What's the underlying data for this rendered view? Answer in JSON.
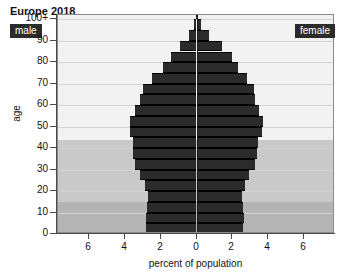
{
  "chart_data": {
    "type": "bar",
    "subtype": "population-pyramid",
    "title": "Europe 2018",
    "xlabel": "percent of population",
    "ylabel": "age",
    "xlim": [
      -7.75,
      7.75
    ],
    "ylim": [
      0,
      102
    ],
    "xticks": [
      -6,
      -4,
      -2,
      0,
      2,
      4,
      6
    ],
    "xticklabels": [
      "6",
      "4",
      "2",
      "0",
      "2",
      "4",
      "6"
    ],
    "yticks": [
      0,
      10,
      20,
      30,
      40,
      50,
      60,
      70,
      80,
      90,
      100
    ],
    "yticklabels": [
      "0",
      "10",
      "20",
      "30",
      "40",
      "50",
      "60",
      "70",
      "80",
      "90",
      "100+"
    ],
    "grid": "horizontal",
    "legend_position": "inside-top-corners",
    "series": [
      {
        "name": "male",
        "side": "left",
        "label": "male"
      },
      {
        "name": "female",
        "side": "right",
        "label": "female"
      }
    ],
    "age_groups": [
      "0-4",
      "5-9",
      "10-14",
      "15-19",
      "20-24",
      "25-29",
      "30-34",
      "35-39",
      "40-44",
      "45-49",
      "50-54",
      "55-59",
      "60-64",
      "65-69",
      "70-74",
      "75-79",
      "80-84",
      "85-89",
      "90-94",
      "95-99",
      "100+"
    ],
    "male_values": [
      2.85,
      2.85,
      2.75,
      2.7,
      2.9,
      3.15,
      3.45,
      3.55,
      3.55,
      3.7,
      3.7,
      3.45,
      3.15,
      3.0,
      2.5,
      1.85,
      1.45,
      0.9,
      0.4,
      0.12,
      0.03
    ],
    "female_values": [
      2.6,
      2.65,
      2.6,
      2.55,
      2.7,
      2.95,
      3.25,
      3.4,
      3.45,
      3.65,
      3.7,
      3.5,
      3.3,
      3.2,
      2.85,
      2.3,
      2.0,
      1.4,
      0.7,
      0.25,
      0.06
    ],
    "background_bands": [
      {
        "name": "older-band",
        "from": 44,
        "to": 102,
        "color": "#f2f2f2"
      },
      {
        "name": "working-age-band",
        "from": 15,
        "to": 44,
        "color": "#c9c9c9"
      },
      {
        "name": "children-band",
        "from": 0,
        "to": 15,
        "color": "#b4b4b4"
      }
    ],
    "colors": {
      "bar": "#2b2b2b",
      "bar_edge": "#000000",
      "plot_background": "#f2f2f2",
      "grid": "#d2d2d2",
      "axis": "#4a4a4a",
      "center_line": "#1c1c1c",
      "badge_background": "#2b2b2b",
      "badge_text": "#ffffff",
      "text": "#111111"
    }
  }
}
